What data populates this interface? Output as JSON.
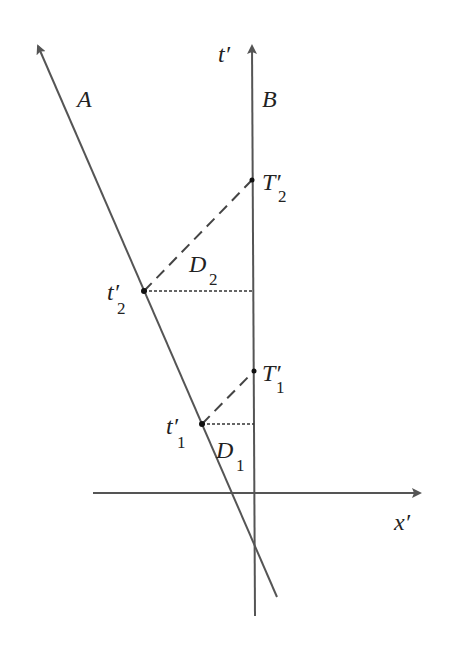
{
  "diagram": {
    "type": "spacetime-diagram",
    "colors": {
      "line": "#555555",
      "text": "#222222",
      "background": "#ffffff"
    },
    "axes": {
      "time_axis_label": "t′",
      "space_axis_label": "x′"
    },
    "worldlines": [
      {
        "id": "A",
        "label": "A"
      },
      {
        "id": "B",
        "label": "B"
      }
    ],
    "events": [
      {
        "id": "t2p",
        "label_main": "t′",
        "label_sub": "2",
        "on": "A"
      },
      {
        "id": "t1p",
        "label_main": "t′",
        "label_sub": "1",
        "on": "A"
      },
      {
        "id": "T2p",
        "label_main": "T′",
        "label_sub": "2",
        "on": "B"
      },
      {
        "id": "T1p",
        "label_main": "T′",
        "label_sub": "1",
        "on": "B"
      }
    ],
    "distances": [
      {
        "id": "D2",
        "label_main": "D",
        "label_sub": "2"
      },
      {
        "id": "D1",
        "label_main": "D",
        "label_sub": "1"
      }
    ]
  }
}
